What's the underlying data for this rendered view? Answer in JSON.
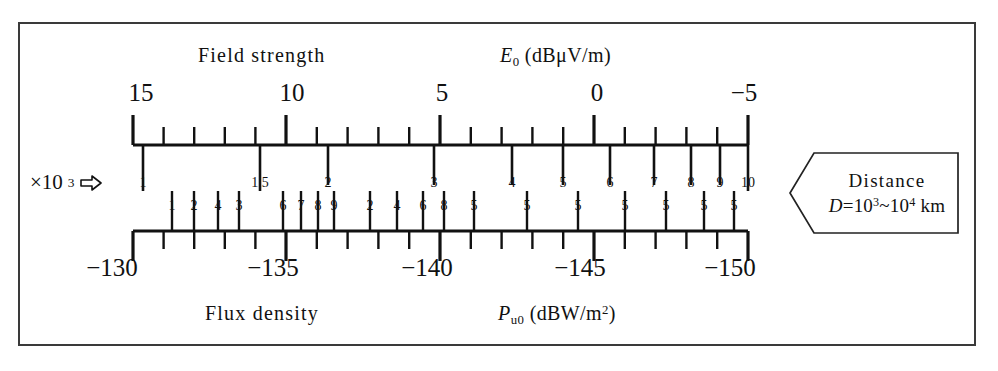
{
  "page": {
    "top_clipped_caption": "(power radiated)",
    "frame_color": "#3a3a3a",
    "ink_color": "#111111"
  },
  "headers": {
    "top_left": "Field  strength",
    "top_right_symbol": "E",
    "top_right_sub": "0",
    "top_right_unit": "(dBμV/m)",
    "bottom_left": "Flux  density",
    "bottom_right_symbol": "P",
    "bottom_right_sub": "u0",
    "bottom_right_unit": "(dBW/m",
    "bottom_right_unit_sup": "2",
    "bottom_right_unit_close": ")"
  },
  "multiplier": {
    "text": "×10",
    "exponent": "3",
    "icon": "arrow-right-outline"
  },
  "distance_callout": {
    "title": "Distance",
    "symbol": "D",
    "equals": "=10",
    "exp1": "3",
    "tilde": "~10",
    "exp2": "4",
    "unit": " km"
  },
  "chart_data": {
    "type": "nomogram",
    "axes": [
      {
        "name": "field_strength",
        "position": "top",
        "label": "Field strength",
        "symbol": "E0",
        "unit": "dBμV/m",
        "major_ticks": [
          15,
          10,
          5,
          0,
          -5
        ],
        "major_tick_labels": [
          "15",
          "10",
          "5",
          "0",
          "−5"
        ],
        "range": [
          15,
          -5
        ],
        "minor_ticks_per_major": 5,
        "direction": "decreasing-left-to-right"
      },
      {
        "name": "flux_density",
        "position": "bottom",
        "label": "Flux density",
        "symbol": "Pu0",
        "unit": "dBW/m2",
        "major_ticks": [
          -130,
          -135,
          -140,
          -145,
          -150
        ],
        "major_tick_labels": [
          "−130",
          "−135",
          "−140",
          "−145",
          "−150"
        ],
        "range": [
          -130,
          -150
        ],
        "minor_ticks_per_major": 5,
        "direction": "decreasing-left-to-right"
      }
    ],
    "interior_labels_upper": [
      {
        "value": "1",
        "x": 143
      },
      {
        "value": "1.5",
        "x": 260
      },
      {
        "value": "2",
        "x": 328
      },
      {
        "value": "3",
        "x": 434
      },
      {
        "value": "4",
        "x": 512
      },
      {
        "value": "5",
        "x": 563
      },
      {
        "value": "6",
        "x": 610
      },
      {
        "value": "7",
        "x": 654
      },
      {
        "value": "8",
        "x": 691
      },
      {
        "value": "9",
        "x": 720
      },
      {
        "value": "10",
        "x": 748
      }
    ],
    "interior_labels_lower": [
      {
        "value": "1",
        "x": 172
      },
      {
        "value": "2",
        "x": 194
      },
      {
        "value": "4",
        "x": 218
      },
      {
        "value": "3",
        "x": 239
      },
      {
        "value": "6",
        "x": 283
      },
      {
        "value": "7",
        "x": 301
      },
      {
        "value": "8",
        "x": 318
      },
      {
        "value": "9",
        "x": 334
      },
      {
        "value": "2",
        "x": 370
      },
      {
        "value": "4",
        "x": 397
      },
      {
        "value": "6",
        "x": 423
      },
      {
        "value": "8",
        "x": 444
      },
      {
        "value": "5",
        "x": 474
      },
      {
        "value": "5",
        "x": 527
      },
      {
        "value": "5",
        "x": 578
      },
      {
        "value": "5",
        "x": 625
      },
      {
        "value": "5",
        "x": 666
      },
      {
        "value": "5",
        "x": 704
      },
      {
        "value": "5",
        "x": 734
      }
    ]
  },
  "geometry": {
    "axis_left_x": 133,
    "axis_right_x": 748,
    "top_axis_y": 145,
    "bottom_axis_y": 231,
    "major_positions_top": [
      133,
      286,
      440,
      594,
      748
    ],
    "major_positions_bottom": [
      133,
      286,
      440,
      594,
      748
    ]
  },
  "axis_end_labels": {
    "top": [
      {
        "text": "15",
        "x": 141
      },
      {
        "text": "10",
        "x": 292
      },
      {
        "text": "5",
        "x": 442
      },
      {
        "text": "0",
        "x": 597
      },
      {
        "text": "−5",
        "x": 744
      }
    ],
    "bottom": [
      {
        "text": "−130",
        "x": 112
      },
      {
        "text": "−135",
        "x": 273
      },
      {
        "text": "−140",
        "x": 427
      },
      {
        "text": "−145",
        "x": 580
      },
      {
        "text": "−150",
        "x": 730
      }
    ]
  }
}
